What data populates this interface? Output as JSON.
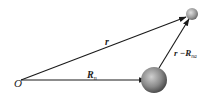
{
  "diagram": {
    "origin_label": "O",
    "vectors": [
      {
        "id": "r",
        "label": "r",
        "from": "O",
        "to": "small-particle"
      },
      {
        "id": "Rn",
        "label": "R",
        "subscript": "n",
        "from": "O",
        "to": "large-particle"
      },
      {
        "id": "r-Rna",
        "label": "r −R",
        "label_main": "r −",
        "label_R": "R",
        "subscript": "na",
        "from": "large-particle",
        "to": "small-particle"
      }
    ],
    "particles": [
      {
        "id": "large-particle",
        "size": "large"
      },
      {
        "id": "small-particle",
        "size": "small"
      }
    ],
    "colors": {
      "line": "#1a1a1a",
      "sphere_light": "#d8d8d8",
      "sphere_dark": "#3a3a3a"
    }
  }
}
